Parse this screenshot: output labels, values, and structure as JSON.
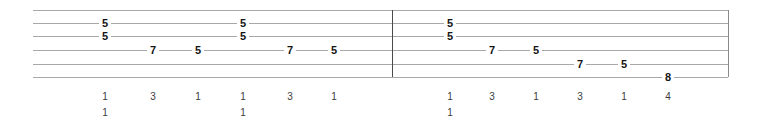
{
  "sheet": {
    "width": 763,
    "height": 128,
    "background_color": "#ffffff",
    "staff_line_color": "#a8a8a8",
    "barline_color": "#4a4a4a",
    "note_color": "#141414",
    "fingering_color": "#3c3c3c",
    "string_count": 6,
    "staff_left": 33,
    "staff_right": 728,
    "string_y": [
      10,
      23,
      36,
      50,
      64,
      77
    ],
    "barline_x": [
      392,
      728
    ]
  },
  "chart_data": {
    "type": "table",
    "title": "",
    "measures": [
      {
        "index": 1,
        "notes": [
          {
            "x": 105,
            "string": 2,
            "fret": "5"
          },
          {
            "x": 105,
            "string": 3,
            "fret": "5"
          },
          {
            "x": 153,
            "string": 4,
            "fret": "7"
          },
          {
            "x": 198,
            "string": 4,
            "fret": "5"
          },
          {
            "x": 243,
            "string": 2,
            "fret": "5"
          },
          {
            "x": 243,
            "string": 3,
            "fret": "5"
          },
          {
            "x": 290,
            "string": 4,
            "fret": "7"
          },
          {
            "x": 334,
            "string": 4,
            "fret": "5"
          }
        ],
        "fingerings_row1": [
          {
            "x": 105,
            "value": "1"
          },
          {
            "x": 153,
            "value": "3"
          },
          {
            "x": 198,
            "value": "1"
          },
          {
            "x": 243,
            "value": "1"
          },
          {
            "x": 290,
            "value": "3"
          },
          {
            "x": 334,
            "value": "1"
          }
        ],
        "fingerings_row2": [
          {
            "x": 105,
            "value": "1"
          },
          {
            "x": 243,
            "value": "1"
          }
        ]
      },
      {
        "index": 2,
        "notes": [
          {
            "x": 450,
            "string": 2,
            "fret": "5"
          },
          {
            "x": 450,
            "string": 3,
            "fret": "5"
          },
          {
            "x": 492,
            "string": 4,
            "fret": "7"
          },
          {
            "x": 536,
            "string": 4,
            "fret": "5"
          },
          {
            "x": 580,
            "string": 5,
            "fret": "7"
          },
          {
            "x": 624,
            "string": 5,
            "fret": "5"
          },
          {
            "x": 668,
            "string": 6,
            "fret": "8"
          }
        ],
        "fingerings_row1": [
          {
            "x": 450,
            "value": "1"
          },
          {
            "x": 492,
            "value": "3"
          },
          {
            "x": 536,
            "value": "1"
          },
          {
            "x": 580,
            "value": "3"
          },
          {
            "x": 624,
            "value": "1"
          },
          {
            "x": 668,
            "value": "4"
          }
        ],
        "fingerings_row2": [
          {
            "x": 450,
            "value": "1"
          }
        ]
      }
    ],
    "fingering_row1_y": 92,
    "fingering_row2_y": 108
  }
}
